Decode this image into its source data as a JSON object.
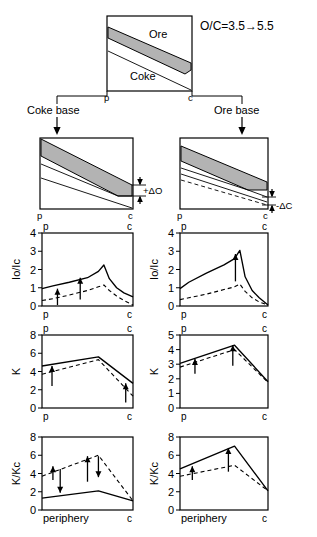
{
  "figure": {
    "title_note": "O/C=3.5→5.5",
    "top_diagram": {
      "ore_label": "Ore",
      "coke_label": "Coke",
      "left_axis_mark": "p",
      "right_axis_mark": "c"
    },
    "branches": [
      {
        "name": "coke-base",
        "label": "Coke base",
        "delta_label": "+ΔO"
      },
      {
        "name": "ore-base",
        "label": "Ore base",
        "delta_label": "-ΔC"
      }
    ],
    "axis_marks": {
      "left": "p",
      "right": "c",
      "periphery": "periphery"
    }
  },
  "chart_data": [
    {
      "id": "io-ic-coke-base",
      "type": "line",
      "title": "",
      "ylabel": "Io/Ic",
      "xlabel": "",
      "xticklabels": [
        "p",
        "c"
      ],
      "yticklabels": [
        "0",
        "1",
        "2",
        "3",
        "4"
      ],
      "ylim": [
        0,
        4
      ],
      "xlim": [
        0,
        1
      ],
      "grid": false,
      "legend": "none",
      "series": [
        {
          "name": "base",
          "style": "solid",
          "x": [
            0.0,
            0.12,
            0.3,
            0.5,
            0.62,
            0.68,
            0.74,
            0.82,
            0.9,
            1.0
          ],
          "y": [
            0.95,
            1.1,
            1.3,
            1.55,
            1.9,
            2.25,
            1.5,
            1.0,
            0.72,
            0.5
          ]
        },
        {
          "name": "changed",
          "style": "dashed",
          "x": [
            0.0,
            0.12,
            0.3,
            0.5,
            0.62,
            0.68,
            0.74,
            0.82,
            0.9,
            1.0
          ],
          "y": [
            0.3,
            0.4,
            0.6,
            0.85,
            1.05,
            1.15,
            0.85,
            0.55,
            0.3,
            0.05
          ]
        }
      ],
      "annotations": [
        {
          "kind": "arrow-up",
          "x": 0.17,
          "y0": 0.05,
          "y1": 0.95
        },
        {
          "kind": "arrow-up",
          "x": 0.42,
          "y0": 0.35,
          "y1": 1.55
        }
      ]
    },
    {
      "id": "io-ic-ore-base",
      "type": "line",
      "title": "",
      "ylabel": "Io/Ic",
      "xlabel": "",
      "xticklabels": [
        "p",
        "c"
      ],
      "yticklabels": [
        "0",
        "1",
        "2",
        "3",
        "4"
      ],
      "ylim": [
        0,
        4
      ],
      "xlim": [
        0,
        1
      ],
      "grid": false,
      "legend": "none",
      "series": [
        {
          "name": "base",
          "style": "solid",
          "x": [
            0.0,
            0.1,
            0.3,
            0.5,
            0.62,
            0.68,
            0.74,
            0.82,
            0.9,
            1.0
          ],
          "y": [
            0.95,
            1.3,
            1.8,
            2.25,
            2.6,
            3.05,
            1.6,
            0.85,
            0.45,
            0.05
          ]
        },
        {
          "name": "changed",
          "style": "dashed",
          "x": [
            0.0,
            0.1,
            0.3,
            0.5,
            0.62,
            0.68,
            0.74,
            0.82,
            0.9,
            1.0
          ],
          "y": [
            0.35,
            0.45,
            0.65,
            0.9,
            1.05,
            1.2,
            0.8,
            0.45,
            0.22,
            0.05
          ]
        }
      ],
      "annotations": [
        {
          "kind": "arrow-up",
          "x": 0.63,
          "y0": 1.35,
          "y1": 2.85
        }
      ]
    },
    {
      "id": "k-coke-base",
      "type": "line",
      "title": "",
      "ylabel": "K",
      "xlabel": "",
      "xticklabels": [
        "p",
        "c"
      ],
      "yticklabels": [
        "0",
        "2",
        "4",
        "6",
        "8"
      ],
      "ylim": [
        0,
        8
      ],
      "xlim": [
        0,
        1
      ],
      "grid": false,
      "legend": "none",
      "series": [
        {
          "name": "base",
          "style": "solid",
          "x": [
            0.0,
            0.62,
            1.0
          ],
          "y": [
            4.6,
            5.6,
            2.7
          ]
        },
        {
          "name": "changed",
          "style": "dashed",
          "x": [
            0.0,
            0.62,
            1.0
          ],
          "y": [
            3.7,
            5.3,
            1.3
          ]
        }
      ],
      "annotations": [
        {
          "kind": "arrow-up",
          "x": 0.11,
          "y0": 2.4,
          "y1": 4.6
        },
        {
          "kind": "arrow-up",
          "x": 0.92,
          "y0": 0.6,
          "y1": 2.7
        }
      ]
    },
    {
      "id": "k-ore-base",
      "type": "line",
      "title": "",
      "ylabel": "K",
      "xlabel": "",
      "xticklabels": [
        "p",
        "c"
      ],
      "yticklabels": [
        "0",
        "1",
        "2",
        "3",
        "4",
        "5"
      ],
      "ylim": [
        0,
        5
      ],
      "xlim": [
        0,
        1
      ],
      "grid": false,
      "legend": "none",
      "series": [
        {
          "name": "base",
          "style": "solid",
          "x": [
            0.0,
            0.62,
            1.0
          ],
          "y": [
            3.05,
            4.3,
            1.8
          ]
        },
        {
          "name": "changed",
          "style": "dashed",
          "x": [
            0.0,
            0.62,
            1.0
          ],
          "y": [
            2.8,
            4.0,
            1.75
          ]
        }
      ],
      "annotations": [
        {
          "kind": "arrow-up",
          "x": 0.17,
          "y0": 2.35,
          "y1": 3.35
        },
        {
          "kind": "arrow-up",
          "x": 0.6,
          "y0": 2.9,
          "y1": 4.3
        }
      ]
    },
    {
      "id": "k-kc-coke-base",
      "type": "line",
      "title": "",
      "ylabel": "K/Kc",
      "xlabel": "periphery",
      "xticklabels": [
        "periphery",
        "c"
      ],
      "yticklabels": [
        "0",
        "2",
        "4",
        "6",
        "8"
      ],
      "ylim": [
        0,
        8
      ],
      "xlim": [
        0,
        1
      ],
      "grid": false,
      "legend": "none",
      "series": [
        {
          "name": "base",
          "style": "solid",
          "x": [
            0.0,
            0.62,
            1.0
          ],
          "y": [
            1.3,
            2.1,
            1.0
          ]
        },
        {
          "name": "changed",
          "style": "dashed",
          "x": [
            0.0,
            0.62,
            1.0
          ],
          "y": [
            3.7,
            6.0,
            1.0
          ]
        }
      ],
      "annotations": [
        {
          "kind": "arrow-up",
          "x": 0.12,
          "y0": 3.3,
          "y1": 4.8
        },
        {
          "kind": "arrow-down",
          "x": 0.2,
          "y0": 4.5,
          "y1": 1.9
        },
        {
          "kind": "arrow-up",
          "x": 0.5,
          "y0": 3.1,
          "y1": 5.9
        },
        {
          "kind": "arrow-down",
          "x": 0.62,
          "y0": 5.9,
          "y1": 3.6
        }
      ]
    },
    {
      "id": "k-kc-ore-base",
      "type": "line",
      "title": "",
      "ylabel": "K/Kc",
      "xlabel": "periphery",
      "xticklabels": [
        "periphery",
        "c"
      ],
      "yticklabels": [
        "0",
        "2",
        "4",
        "6",
        "8"
      ],
      "ylim": [
        0,
        8
      ],
      "xlim": [
        0,
        1
      ],
      "grid": false,
      "legend": "none",
      "series": [
        {
          "name": "base",
          "style": "solid",
          "x": [
            0.0,
            0.62,
            1.0
          ],
          "y": [
            4.5,
            7.0,
            2.1
          ]
        },
        {
          "name": "changed",
          "style": "dashed",
          "x": [
            0.0,
            0.62,
            1.0
          ],
          "y": [
            3.7,
            4.9,
            2.1
          ]
        }
      ],
      "annotations": [
        {
          "kind": "arrow-up",
          "x": 0.14,
          "y0": 3.3,
          "y1": 4.8
        },
        {
          "kind": "arrow-up",
          "x": 0.55,
          "y0": 4.2,
          "y1": 6.8
        }
      ]
    }
  ]
}
